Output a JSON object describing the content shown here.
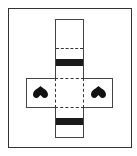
{
  "diagram": {
    "type": "box-net",
    "colors": {
      "line": "#333333",
      "band": "#1a1a1a",
      "symbol": "#111111",
      "background": "#ffffff"
    },
    "symbols": [
      {
        "name": "inverted-heart",
        "position": "left-flap"
      },
      {
        "name": "inverted-heart",
        "position": "right-flap"
      }
    ],
    "bands": [
      {
        "position": "upper-strip"
      },
      {
        "position": "lower-strip"
      }
    ],
    "fold_lines": [
      {
        "position": "upper-strip"
      },
      {
        "position": "center-square"
      }
    ]
  }
}
